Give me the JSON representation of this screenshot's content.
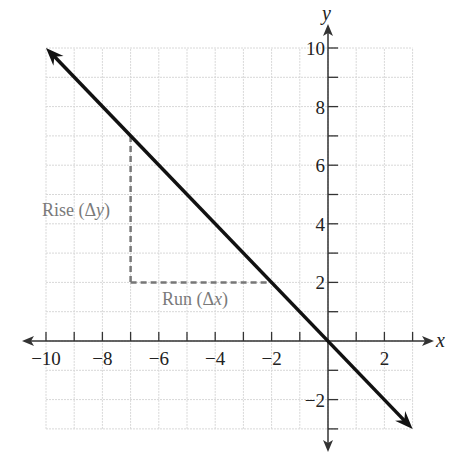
{
  "chart_data": {
    "type": "line",
    "title": "",
    "xlabel": "x",
    "ylabel": "y",
    "xlim": [
      -10,
      3
    ],
    "ylim": [
      -3,
      10
    ],
    "grid": true,
    "x_ticks": [
      -10,
      -8,
      -6,
      -4,
      -2,
      2
    ],
    "y_ticks": [
      -2,
      2,
      4,
      6,
      8,
      10
    ],
    "x_tick_labels": [
      "−10",
      "−8",
      "−6",
      "−4",
      "−2",
      "2"
    ],
    "y_tick_labels": [
      "−2",
      "2",
      "4",
      "6",
      "8",
      "10"
    ],
    "series": [
      {
        "name": "line",
        "equation": "y = -x",
        "x": [
          -10,
          -7,
          -2,
          0,
          3
        ],
        "y": [
          10,
          7,
          2,
          0,
          -3
        ],
        "arrows_both_ends": true
      }
    ],
    "annotations": [
      {
        "text": "Rise (Δy)",
        "type": "dashed-vertical",
        "from": [
          -7,
          7
        ],
        "to": [
          -7,
          2
        ]
      },
      {
        "text": "Run (Δx)",
        "type": "dashed-horizontal",
        "from": [
          -7,
          2
        ],
        "to": [
          -2,
          2
        ]
      }
    ]
  },
  "labels": {
    "x_axis": "x",
    "y_axis": "y",
    "rise": "Rise (Δ",
    "rise_var": "y",
    "rise_close": ")",
    "run": "Run (Δ",
    "run_var": "x",
    "run_close": ")"
  },
  "colors": {
    "line": "#111111",
    "axis": "#333333",
    "grid": "#d8d8d8",
    "dashed": "#777777",
    "annotation_text": "#7a7a7a"
  }
}
